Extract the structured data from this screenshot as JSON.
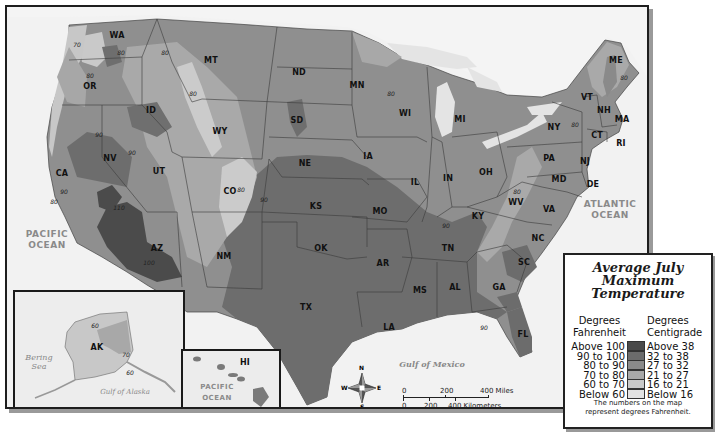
{
  "legend": {
    "title_lines": [
      "Average July",
      "Maximum",
      "Temperature"
    ],
    "fahrenheit_header": [
      "Degrees",
      "Fahrenheit"
    ],
    "centigrade_header": [
      "Degrees",
      "Centigrade"
    ],
    "rows": [
      {
        "fahrenheit": "Above 100",
        "centigrade": "Above 38",
        "color": "#4a4a4a"
      },
      {
        "fahrenheit": "90 to 100",
        "centigrade": "32 to 38",
        "color": "#6b6b6b"
      },
      {
        "fahrenheit": "80 to 90",
        "centigrade": "27 to 32",
        "color": "#8a8a8a"
      },
      {
        "fahrenheit": "70 to 80",
        "centigrade": "21 to 27",
        "color": "#a8a8a8"
      },
      {
        "fahrenheit": "60 to 70",
        "centigrade": "16 to 21",
        "color": "#c9c9c9"
      },
      {
        "fahrenheit": "Below 60",
        "centigrade": "Below 16",
        "color": "#e3e3e3"
      }
    ],
    "note_lines": [
      "The numbers on the map",
      "represent degrees Fahrenheit."
    ]
  },
  "water_labels": {
    "pacific": [
      "PACIFIC",
      "OCEAN"
    ],
    "atlantic": [
      "ATLANTIC",
      "OCEAN"
    ],
    "gulf_mexico": "Gulf of Mexico",
    "bering": [
      "Bering",
      "Sea"
    ],
    "gulf_alaska": "Gulf of Alaska",
    "hi_pacific": "PACIFIC OCEAN"
  },
  "states": [
    {
      "abbr": "WA",
      "x": 110,
      "y": 28
    },
    {
      "abbr": "OR",
      "x": 83,
      "y": 79
    },
    {
      "abbr": "CA",
      "x": 55,
      "y": 166
    },
    {
      "abbr": "NV",
      "x": 103,
      "y": 151
    },
    {
      "abbr": "ID",
      "x": 144,
      "y": 103
    },
    {
      "abbr": "MT",
      "x": 204,
      "y": 53
    },
    {
      "abbr": "WY",
      "x": 213,
      "y": 124
    },
    {
      "abbr": "UT",
      "x": 152,
      "y": 164
    },
    {
      "abbr": "CO",
      "x": 223,
      "y": 184
    },
    {
      "abbr": "AZ",
      "x": 150,
      "y": 241
    },
    {
      "abbr": "NM",
      "x": 217,
      "y": 249
    },
    {
      "abbr": "ND",
      "x": 292,
      "y": 65
    },
    {
      "abbr": "SD",
      "x": 290,
      "y": 113
    },
    {
      "abbr": "NE",
      "x": 298,
      "y": 156
    },
    {
      "abbr": "KS",
      "x": 309,
      "y": 199
    },
    {
      "abbr": "OK",
      "x": 314,
      "y": 241
    },
    {
      "abbr": "TX",
      "x": 299,
      "y": 300
    },
    {
      "abbr": "MN",
      "x": 350,
      "y": 78
    },
    {
      "abbr": "IA",
      "x": 361,
      "y": 149
    },
    {
      "abbr": "MO",
      "x": 373,
      "y": 204
    },
    {
      "abbr": "AR",
      "x": 376,
      "y": 256
    },
    {
      "abbr": "LA",
      "x": 382,
      "y": 320
    },
    {
      "abbr": "WI",
      "x": 398,
      "y": 106
    },
    {
      "abbr": "IL",
      "x": 408,
      "y": 175
    },
    {
      "abbr": "MI",
      "x": 453,
      "y": 112
    },
    {
      "abbr": "IN",
      "x": 441,
      "y": 171
    },
    {
      "abbr": "OH",
      "x": 479,
      "y": 165
    },
    {
      "abbr": "KY",
      "x": 471,
      "y": 209
    },
    {
      "abbr": "TN",
      "x": 441,
      "y": 241
    },
    {
      "abbr": "MS",
      "x": 413,
      "y": 283
    },
    {
      "abbr": "AL",
      "x": 448,
      "y": 280
    },
    {
      "abbr": "GA",
      "x": 492,
      "y": 280
    },
    {
      "abbr": "FL",
      "x": 516,
      "y": 327
    },
    {
      "abbr": "SC",
      "x": 517,
      "y": 255
    },
    {
      "abbr": "NC",
      "x": 531,
      "y": 231
    },
    {
      "abbr": "VA",
      "x": 542,
      "y": 202
    },
    {
      "abbr": "WV",
      "x": 509,
      "y": 195
    },
    {
      "abbr": "PA",
      "x": 542,
      "y": 151
    },
    {
      "abbr": "NY",
      "x": 547,
      "y": 120
    },
    {
      "abbr": "MD",
      "x": 552,
      "y": 172
    },
    {
      "abbr": "DE",
      "x": 586,
      "y": 177
    },
    {
      "abbr": "NJ",
      "x": 578,
      "y": 154
    },
    {
      "abbr": "CT",
      "x": 590,
      "y": 128
    },
    {
      "abbr": "RI",
      "x": 614,
      "y": 136
    },
    {
      "abbr": "MA",
      "x": 615,
      "y": 112
    },
    {
      "abbr": "NH",
      "x": 597,
      "y": 103
    },
    {
      "abbr": "VT",
      "x": 580,
      "y": 90
    },
    {
      "abbr": "ME",
      "x": 609,
      "y": 53
    }
  ],
  "isotherm_labels": [
    {
      "text": "70",
      "x": 70,
      "y": 37
    },
    {
      "text": "80",
      "x": 114,
      "y": 45
    },
    {
      "text": "80",
      "x": 83,
      "y": 68
    },
    {
      "text": "80",
      "x": 158,
      "y": 45
    },
    {
      "text": "80",
      "x": 186,
      "y": 86
    },
    {
      "text": "90",
      "x": 92,
      "y": 127
    },
    {
      "text": "90",
      "x": 125,
      "y": 145
    },
    {
      "text": "90",
      "x": 57,
      "y": 184
    },
    {
      "text": "80",
      "x": 47,
      "y": 194
    },
    {
      "text": "110",
      "x": 112,
      "y": 200
    },
    {
      "text": "100",
      "x": 142,
      "y": 255
    },
    {
      "text": "80",
      "x": 234,
      "y": 182
    },
    {
      "text": "90",
      "x": 257,
      "y": 192
    },
    {
      "text": "80",
      "x": 384,
      "y": 86
    },
    {
      "text": "80",
      "x": 568,
      "y": 117
    },
    {
      "text": "80",
      "x": 617,
      "y": 70
    },
    {
      "text": "80",
      "x": 510,
      "y": 184
    },
    {
      "text": "90",
      "x": 439,
      "y": 218
    },
    {
      "text": "90",
      "x": 477,
      "y": 320
    },
    {
      "text": "60",
      "x": 80,
      "y": 33,
      "inset": "ak"
    },
    {
      "text": "70",
      "x": 111,
      "y": 62,
      "inset": "ak"
    },
    {
      "text": "60",
      "x": 115,
      "y": 80,
      "inset": "ak"
    }
  ],
  "alaska": {
    "label": "AK"
  },
  "hawaii": {
    "label": "HI"
  },
  "compass": {
    "n": "N",
    "s": "S",
    "e": "E",
    "w": "W"
  },
  "scale": {
    "miles": [
      "0",
      "200",
      "400 Miles"
    ],
    "kilometers": [
      "0",
      "200",
      "400 Kilometers"
    ]
  }
}
